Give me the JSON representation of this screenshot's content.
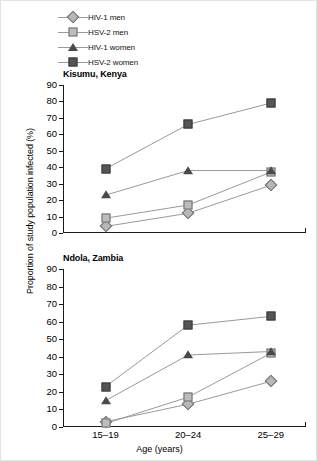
{
  "figure": {
    "ylabel": "Proportion of study population infected (%)",
    "xlabel": "Age (years)"
  },
  "legend": {
    "items": [
      {
        "label": "HIV-1 men",
        "marker": "diamond",
        "key": "hiv1_men"
      },
      {
        "label": "HSV-2 men",
        "marker": "square-light",
        "key": "hsv2_men"
      },
      {
        "label": "HIV-1 women",
        "marker": "triangle",
        "key": "hiv1_women"
      },
      {
        "label": "HSV-2 women",
        "marker": "square-dark",
        "key": "hsv2_women"
      }
    ]
  },
  "axis": {
    "yticks": [
      90,
      80,
      70,
      60,
      50,
      40,
      30,
      20,
      10,
      0
    ],
    "xticks": [
      "15–19",
      "20–24",
      "25–29"
    ],
    "ymin": 0,
    "ymax": 90
  },
  "panels": [
    {
      "title": "Kisumu, Kenya"
    },
    {
      "title": "Ndola, Zambia"
    }
  ],
  "chart_data": [
    {
      "type": "line",
      "title": "Kisumu, Kenya",
      "xlabel": "Age (years)",
      "ylabel": "Proportion of study population infected (%)",
      "categories": [
        "15–19",
        "20–24",
        "25–29"
      ],
      "ylim": [
        0,
        90
      ],
      "ytick_step": 10,
      "grid": false,
      "legend_position": "above-figure",
      "series": [
        {
          "name": "HIV-1 men",
          "marker": "diamond",
          "values": [
            4,
            12,
            29
          ]
        },
        {
          "name": "HSV-2 men",
          "marker": "square-light",
          "values": [
            9,
            17,
            37
          ]
        },
        {
          "name": "HIV-1 women",
          "marker": "triangle",
          "values": [
            23,
            38,
            38
          ]
        },
        {
          "name": "HSV-2 women",
          "marker": "square-dark",
          "values": [
            39,
            66,
            79
          ]
        }
      ]
    },
    {
      "type": "line",
      "title": "Ndola, Zambia",
      "xlabel": "Age (years)",
      "ylabel": "Proportion of study population infected (%)",
      "categories": [
        "15–19",
        "20–24",
        "25–29"
      ],
      "ylim": [
        0,
        90
      ],
      "ytick_step": 10,
      "grid": false,
      "legend_position": "above-figure",
      "series": [
        {
          "name": "HIV-1 men",
          "marker": "diamond",
          "values": [
            3,
            13,
            26
          ]
        },
        {
          "name": "HSV-2 men",
          "marker": "square-light",
          "values": [
            2,
            17,
            42
          ]
        },
        {
          "name": "HIV-1 women",
          "marker": "triangle",
          "values": [
            15,
            41,
            43
          ]
        },
        {
          "name": "HSV-2 women",
          "marker": "square-dark",
          "values": [
            23,
            58,
            63
          ]
        }
      ]
    }
  ],
  "colors": {
    "line": "#9a9a9a",
    "axis": "#1a1a1a",
    "diamond_fill": "#b7b7b7",
    "square_light_fill": "#bdbdbd",
    "square_dark_fill": "#555555",
    "triangle_fill": "#4a4a4a"
  }
}
